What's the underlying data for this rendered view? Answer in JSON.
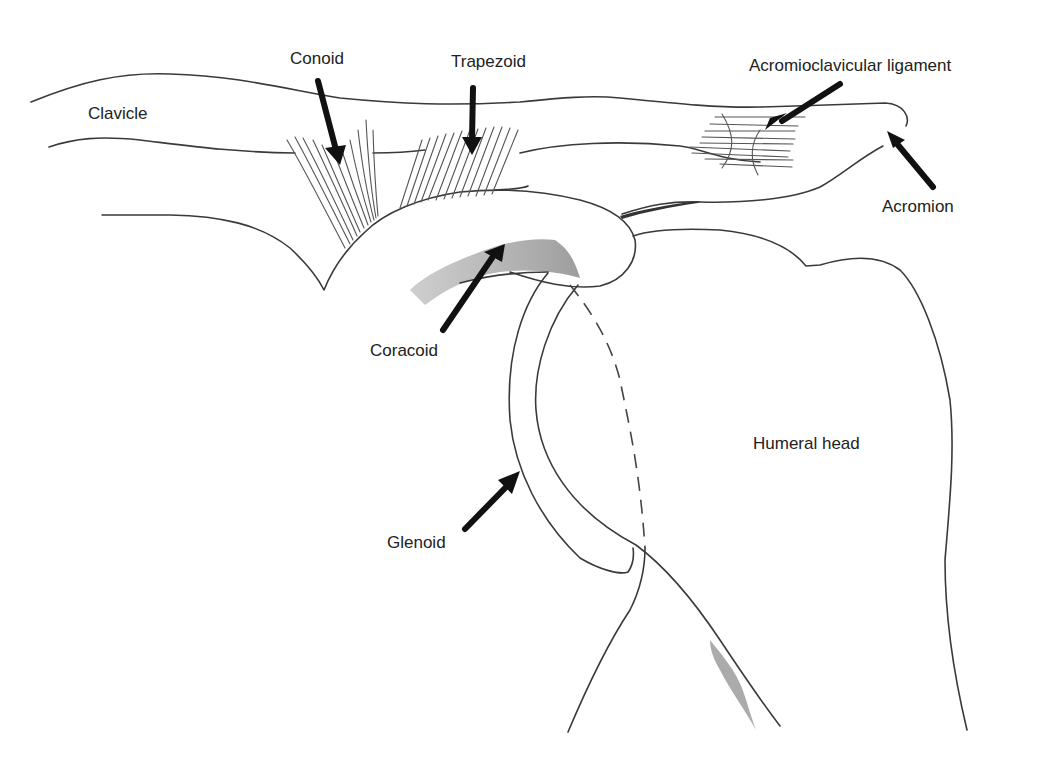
{
  "figure": {
    "stroke_color": "#3a3a3a",
    "arrow_color": "#111111",
    "shading_color": "#888888",
    "background": "#ffffff"
  },
  "labels": {
    "clavicle": "Clavicle",
    "conoid": "Conoid",
    "trapezoid": "Trapezoid",
    "acromioclavicular_ligament": "Acromioclavicular ligament",
    "acromion": "Acromion",
    "coracoid": "Coracoid",
    "glenoid": "Glenoid",
    "humeral_head": "Humeral head"
  },
  "structures": [
    {
      "name": "Clavicle",
      "type": "bone",
      "has_arrow": false
    },
    {
      "name": "Conoid",
      "type": "ligament",
      "has_arrow": true
    },
    {
      "name": "Trapezoid",
      "type": "ligament",
      "has_arrow": true
    },
    {
      "name": "Acromioclavicular ligament",
      "type": "ligament",
      "has_arrow": true
    },
    {
      "name": "Acromion",
      "type": "bone",
      "has_arrow": true
    },
    {
      "name": "Coracoid",
      "type": "bone",
      "has_arrow": true
    },
    {
      "name": "Glenoid",
      "type": "bone",
      "has_arrow": true
    },
    {
      "name": "Humeral head",
      "type": "bone",
      "has_arrow": false
    }
  ]
}
